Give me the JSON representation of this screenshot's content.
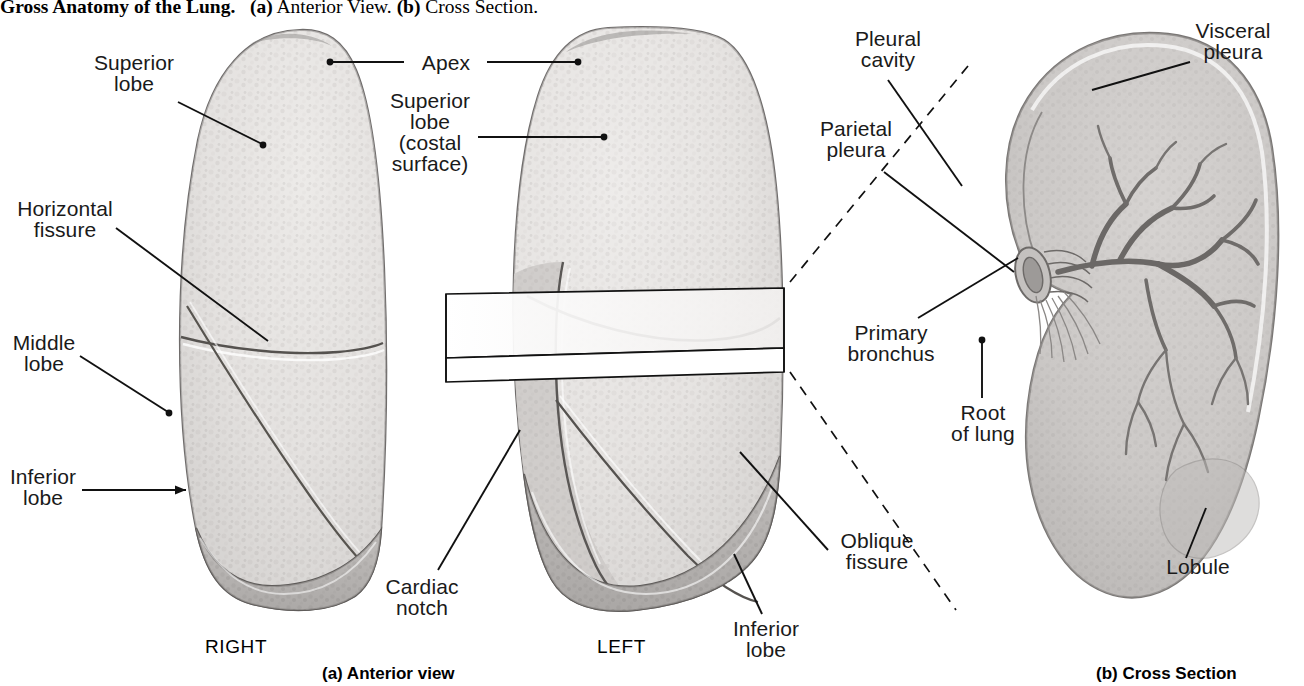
{
  "figure": {
    "title_bold": "Gross Anatomy of the Lung.",
    "title_a_tag": "(a)",
    "title_a_text": "Anterior View.",
    "title_b_tag": "(b)",
    "title_b_text": "Cross Section."
  },
  "captions": {
    "panel_a": "(a) Anterior view",
    "panel_b": "(b) Cross Section"
  },
  "orientation": {
    "right": "RIGHT",
    "left": "LEFT"
  },
  "labels": {
    "superior_lobe": {
      "l1": "Superior",
      "l2": "lobe"
    },
    "horizontal_fissure": {
      "l1": "Horizontal",
      "l2": "fissure"
    },
    "middle_lobe": {
      "l1": "Middle",
      "l2": "lobe"
    },
    "inferior_lobe_right": {
      "l1": "Inferior",
      "l2": "lobe"
    },
    "apex": {
      "l1": "Apex"
    },
    "superior_lobe_costal": {
      "l1": "Superior",
      "l2": "lobe",
      "l3": "(costal",
      "l4": "surface)"
    },
    "cardiac_notch": {
      "l1": "Cardiac",
      "l2": "notch"
    },
    "oblique_fissure": {
      "l1": "Oblique",
      "l2": "fissure"
    },
    "inferior_lobe_left": {
      "l1": "Inferior",
      "l2": "lobe"
    },
    "pleural_cavity": {
      "l1": "Pleural",
      "l2": "cavity"
    },
    "parietal_pleura": {
      "l1": "Parietal",
      "l2": "pleura"
    },
    "primary_bronchus": {
      "l1": "Primary",
      "l2": "bronchus"
    },
    "root_of_lung": {
      "l1": "Root",
      "l2": "of lung"
    },
    "visceral_pleura": {
      "l1": "Visceral",
      "l2": "pleura"
    },
    "lobule": {
      "l1": "Lobule"
    }
  },
  "colors": {
    "ink": "#1a1a1a",
    "leader": "#111111",
    "tissue_light": "#e8e6e4",
    "tissue_mid": "#cfcccb",
    "tissue_dark": "#a9a6a4",
    "outline": "#6f6c6b",
    "background": "#ffffff"
  }
}
